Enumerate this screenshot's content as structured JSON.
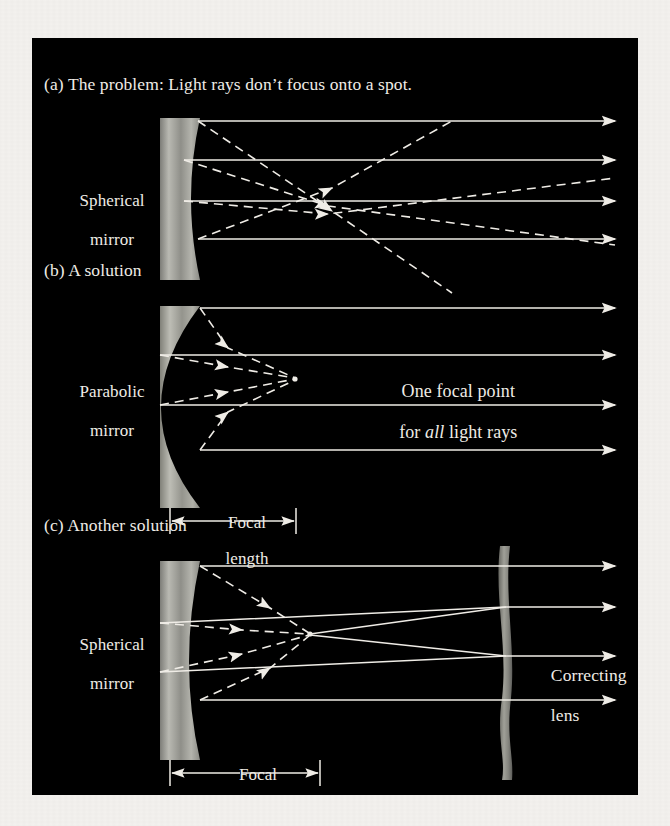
{
  "figure": {
    "background_color": "#000000",
    "page_color": "#f3f1ee",
    "ray_color": "#efece6",
    "mirror_color": "#9a9a94",
    "panels": [
      {
        "id": "a",
        "title": "(a) The problem: Light rays don’t focus onto a spot.",
        "mirror_label_line1": "Spherical",
        "mirror_label_line2": "mirror",
        "mirror_type": "spherical",
        "focus_behavior": "no-single-focus",
        "incoming_ray_count": 4,
        "ray_y": [
          121,
          160,
          201,
          239
        ]
      },
      {
        "id": "b",
        "title": "(b) A solution",
        "mirror_label_line1": "Parabolic",
        "mirror_label_line2": "mirror",
        "mirror_type": "parabolic",
        "focus_behavior": "single-focus",
        "note_line1": "One focal point",
        "note_line2_pre": "for ",
        "note_line2_em": "all",
        "note_line2_post": " light rays",
        "focal_label_line1": "Focal",
        "focal_label_line2": "length",
        "incoming_ray_count": 4,
        "ray_y": [
          308,
          355,
          405,
          450
        ]
      },
      {
        "id": "c",
        "title": "(c) Another solution",
        "mirror_label_line1": "Spherical",
        "mirror_label_line2": "mirror",
        "mirror_type": "spherical",
        "focus_behavior": "single-focus-with-corrector",
        "lens_label_line1": "Correcting",
        "lens_label_line2": "lens",
        "focal_label_line1": "Focal",
        "focal_label_line2": "length",
        "incoming_ray_count": 4,
        "ray_y": [
          566,
          607,
          656,
          700
        ]
      }
    ]
  }
}
